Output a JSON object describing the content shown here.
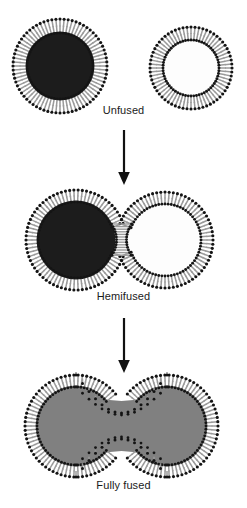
{
  "figure": {
    "background_color": "#ffffff",
    "ink_color": "#1a1a1a"
  },
  "palette": {
    "lipid_head": "#141414",
    "lipid_tail": "#9a9a9a",
    "lumen_dark": "#1c1c1c",
    "lumen_light": "#fdfdfd",
    "lumen_merged": "#808080",
    "arrow": "#111111",
    "label_text": "#1a1a1a"
  },
  "stages": [
    {
      "id": "unfused",
      "label": "Unfused",
      "description": "Two separate vesicles, one with dark lumen and one with light lumen",
      "vesicles": [
        {
          "name": "dark-vesicle",
          "lumen": "dark",
          "cx": 60,
          "cy": 54,
          "r_inner": 33,
          "r_outer": 47,
          "lipid_count": 72
        },
        {
          "name": "light-vesicle",
          "lumen": "light",
          "cx": 191,
          "cy": 56,
          "r_inner": 28,
          "r_outer": 41,
          "lipid_count": 64
        }
      ]
    },
    {
      "id": "hemifused",
      "label": "Hemifused",
      "description": "Two vesicles in contact sharing a merged outer leaflet stalk; lumens remain separate",
      "vesicles": [
        {
          "name": "dark-vesicle",
          "lumen": "dark",
          "cx": 76,
          "cy": 52,
          "r_inner": 38,
          "r_outer": 50,
          "lipid_count": 74
        },
        {
          "name": "light-vesicle",
          "lumen": "light",
          "cx": 165,
          "cy": 52,
          "r_inner": 36,
          "r_outer": 48,
          "lipid_count": 72
        }
      ]
    },
    {
      "id": "fused",
      "label": "Fully fused",
      "description": "Single continuous compartment with a narrow neck; lumen contents mixed to uniform gray",
      "vesicles": [
        {
          "name": "left-lobe",
          "lumen": "merged",
          "cx": 76,
          "cy": 54,
          "r_inner": 39,
          "r_outer": 51,
          "lipid_count": 74
        },
        {
          "name": "right-lobe",
          "lumen": "merged",
          "cx": 167,
          "cy": 54,
          "r_inner": 39,
          "r_outer": 51,
          "lipid_count": 74
        }
      ]
    }
  ],
  "arrows": [
    {
      "id": "arrow-unfused-to-hemifused",
      "direction": "down",
      "length": 52
    },
    {
      "id": "arrow-hemifused-to-fused",
      "direction": "down",
      "length": 52
    }
  ]
}
